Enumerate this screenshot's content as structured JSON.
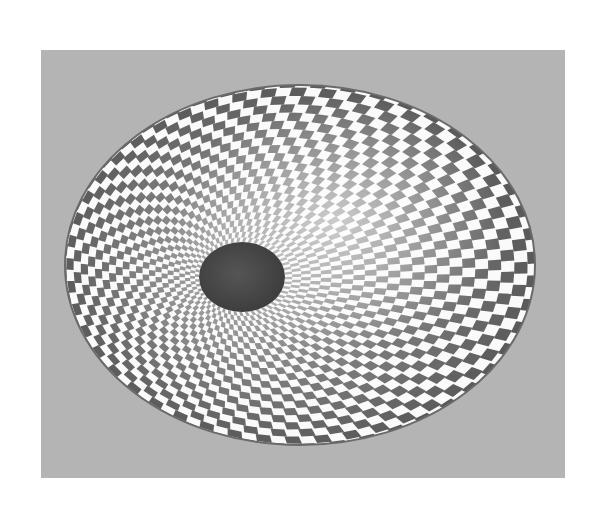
{
  "image": {
    "subject": "checkerboard-patterned bowl viewed from above",
    "colors": {
      "page_background": "#ffffff",
      "backdrop": "#b4b4b4",
      "check_light": "#fafafa",
      "check_dark": "#5a5a5a",
      "center": "#4a4a4a",
      "rim": "#6a6a6a"
    },
    "frame": {
      "x": 41,
      "y": 50,
      "width": 524,
      "height": 428
    },
    "bowl": {
      "cx": 300,
      "cy": 265,
      "rx": 235,
      "ry": 180
    },
    "center_hole": {
      "cx": 242,
      "cy": 277,
      "rx": 43,
      "ry": 35
    },
    "pattern": {
      "rings": 22,
      "sectors": 96
    }
  }
}
